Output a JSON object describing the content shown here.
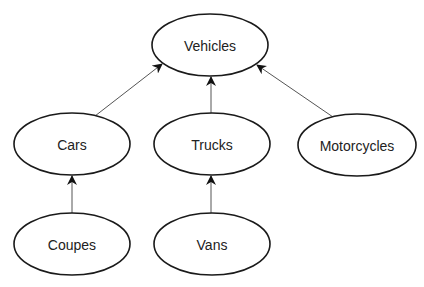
{
  "diagram": {
    "type": "hierarchy",
    "nodes": [
      {
        "id": "vehicles",
        "label": "Vehicles",
        "cx": 210,
        "cy": 45,
        "rx": 58,
        "ry": 31
      },
      {
        "id": "cars",
        "label": "Cars",
        "cx": 72,
        "cy": 144,
        "rx": 58,
        "ry": 31
      },
      {
        "id": "trucks",
        "label": "Trucks",
        "cx": 212,
        "cy": 144,
        "rx": 58,
        "ry": 31
      },
      {
        "id": "motorcycles",
        "label": "Motorcycles",
        "cx": 357,
        "cy": 145,
        "rx": 59,
        "ry": 31
      },
      {
        "id": "coupes",
        "label": "Coupes",
        "cx": 72,
        "cy": 244,
        "rx": 58,
        "ry": 31
      },
      {
        "id": "vans",
        "label": "Vans",
        "cx": 212,
        "cy": 244,
        "rx": 58,
        "ry": 31
      }
    ],
    "edges": [
      {
        "from": "cars",
        "to": "vehicles",
        "x1": 95,
        "y1": 116,
        "x2": 162,
        "y2": 64
      },
      {
        "from": "trucks",
        "to": "vehicles",
        "x1": 211,
        "y1": 113,
        "x2": 211,
        "y2": 77
      },
      {
        "from": "motorcycles",
        "to": "vehicles",
        "x1": 333,
        "y1": 117,
        "x2": 257,
        "y2": 65
      },
      {
        "from": "coupes",
        "to": "cars",
        "x1": 72,
        "y1": 213,
        "x2": 72,
        "y2": 176
      },
      {
        "from": "vans",
        "to": "trucks",
        "x1": 211,
        "y1": 213,
        "x2": 211,
        "y2": 176
      }
    ],
    "colors": {
      "stroke": "#1a1a1a",
      "edge": "#555555",
      "fill": "#ffffff",
      "text": "#222222"
    }
  }
}
